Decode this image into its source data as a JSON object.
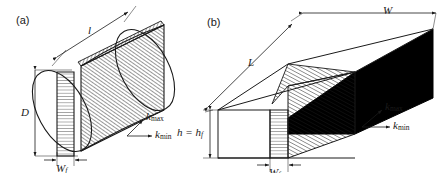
{
  "figure": {
    "background": "#ffffff",
    "line_color": "#1a1a1a",
    "fill_black": "#000000",
    "panels": [
      {
        "id": "a",
        "label": "(a)",
        "shape": "cylinder",
        "dimensions": [
          {
            "name": "D",
            "symbol": "D",
            "subscript": "",
            "orientation": "vertical",
            "description": "cylinder diameter"
          },
          {
            "name": "l",
            "symbol": "l",
            "subscript": "",
            "orientation": "diagonal",
            "description": "cylinder length"
          },
          {
            "name": "Wf",
            "symbol": "W",
            "subscript": "f",
            "orientation": "horizontal",
            "description": "fibre slab width"
          }
        ],
        "direction_arrows": [
          {
            "name": "kmax",
            "symbol": "k",
            "subscript": "max"
          },
          {
            "name": "kmin",
            "symbol": "k",
            "subscript": "min"
          }
        ]
      },
      {
        "id": "b",
        "label": "(b)",
        "shape": "rectangular-prism",
        "dimensions": [
          {
            "name": "W",
            "symbol": "W",
            "subscript": "",
            "orientation": "horizontal",
            "description": "prism width"
          },
          {
            "name": "L",
            "symbol": "L",
            "subscript": "",
            "orientation": "diagonal",
            "description": "prism length"
          },
          {
            "name": "h",
            "symbol": "h = h",
            "subscript": "f",
            "orientation": "vertical",
            "description": "prism height equals fibre height"
          },
          {
            "name": "Wf",
            "symbol": "W",
            "subscript": "f",
            "orientation": "horizontal",
            "description": "fibre slab width"
          }
        ],
        "direction_arrows": [
          {
            "name": "kmax",
            "symbol": "k",
            "subscript": "max"
          },
          {
            "name": "kmin",
            "symbol": "k",
            "subscript": "min"
          }
        ]
      }
    ],
    "labels": {
      "panel_a": "(a)",
      "panel_b": "(b)",
      "D": "D",
      "l": "l",
      "W": "W",
      "L": "L",
      "k": "k",
      "h_eq": "h = h",
      "sub_f": "f",
      "sub_max": "max",
      "sub_min": "min"
    }
  }
}
